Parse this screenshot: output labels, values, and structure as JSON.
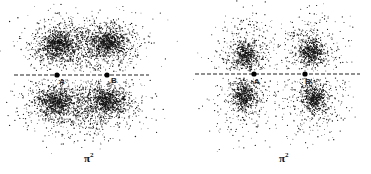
{
  "figure": {
    "panels": [
      {
        "id": "left",
        "caption": "π",
        "caption_superscript": "2",
        "axis": {
          "x1": 14,
          "x2": 149,
          "y": 75
        },
        "atoms": [
          {
            "label": "A",
            "x": 57,
            "y": 75
          },
          {
            "label": "B",
            "x": 107,
            "y": 75
          }
        ],
        "lobes": [
          {
            "cx": 58,
            "cy": 45,
            "rx": 30,
            "ry": 24,
            "n": 900,
            "core": 0.5
          },
          {
            "cx": 108,
            "cy": 43,
            "rx": 30,
            "ry": 24,
            "n": 900,
            "core": 0.5
          },
          {
            "cx": 82,
            "cy": 46,
            "rx": 58,
            "ry": 30,
            "n": 900,
            "core": 0.9
          },
          {
            "cx": 55,
            "cy": 102,
            "rx": 30,
            "ry": 24,
            "n": 900,
            "core": 0.5
          },
          {
            "cx": 108,
            "cy": 101,
            "rx": 30,
            "ry": 24,
            "n": 900,
            "core": 0.5
          },
          {
            "cx": 84,
            "cy": 106,
            "rx": 60,
            "ry": 32,
            "n": 900,
            "core": 0.9
          }
        ]
      },
      {
        "id": "right",
        "caption": "π",
        "caption_superscript": "2",
        "axis": {
          "x1": 195,
          "x2": 360,
          "y": 74
        },
        "atoms": [
          {
            "label": "A",
            "x": 254,
            "y": 74
          },
          {
            "label": "B",
            "x": 305,
            "y": 74
          }
        ],
        "lobes": [
          {
            "cx": 246,
            "cy": 55,
            "rx": 34,
            "ry": 38,
            "n": 900,
            "core": 0.35
          },
          {
            "cx": 311,
            "cy": 52,
            "rx": 34,
            "ry": 38,
            "n": 900,
            "core": 0.35
          },
          {
            "cx": 245,
            "cy": 96,
            "rx": 34,
            "ry": 40,
            "n": 900,
            "core": 0.35
          },
          {
            "cx": 314,
            "cy": 98,
            "rx": 34,
            "ry": 40,
            "n": 900,
            "core": 0.35
          }
        ]
      }
    ],
    "colors": {
      "dots": "#111111",
      "axis": "#222222",
      "background": "#ffffff"
    }
  }
}
